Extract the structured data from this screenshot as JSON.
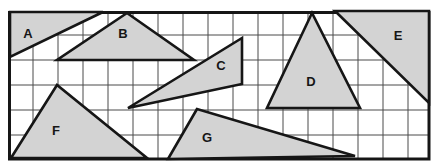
{
  "figure": {
    "background": "#ffffff",
    "frame": {
      "x": 9.5,
      "y": 12.5,
      "width": 419.5,
      "height": 146.5,
      "stroke": "#161616",
      "stroke_width": 3
    },
    "grid": {
      "cell_size": 25,
      "vertical_start": 33,
      "vertical_end": 408,
      "horizontal_start": 35,
      "horizontal_end": 135,
      "color": "#4a4a4a",
      "line_width": 1
    },
    "shape_fill": "#d3d3d3",
    "shape_stroke": "#161616",
    "shape_stroke_width": 2.6,
    "label_color": "#161616",
    "label_font_size": 13,
    "shapes": [
      {
        "label": "A",
        "vertices": [
          [
            10,
            12
          ],
          [
            103,
            12
          ],
          [
            10,
            57
          ]
        ],
        "label_pos": [
          28,
          33
        ]
      },
      {
        "label": "B",
        "vertices": [
          [
            127,
            13
          ],
          [
            57,
            60
          ],
          [
            194,
            60
          ]
        ],
        "label_pos": [
          123,
          33
        ]
      },
      {
        "label": "C",
        "vertices": [
          [
            128,
            108
          ],
          [
            242,
            38
          ],
          [
            242,
            84
          ]
        ],
        "label_pos": [
          221,
          65
        ]
      },
      {
        "label": "D",
        "vertices": [
          [
            312,
            13
          ],
          [
            267,
            108
          ],
          [
            360,
            108
          ]
        ],
        "label_pos": [
          311,
          81
        ]
      },
      {
        "label": "E",
        "vertices": [
          [
            335,
            11
          ],
          [
            429,
            11
          ],
          [
            429,
            103
          ]
        ],
        "label_pos": [
          398,
          35
        ]
      },
      {
        "label": "F",
        "vertices": [
          [
            57,
            85
          ],
          [
            11,
            158
          ],
          [
            147,
            158
          ]
        ],
        "label_pos": [
          56,
          130
        ]
      },
      {
        "label": "G",
        "vertices": [
          [
            197,
            109
          ],
          [
            168,
            159
          ],
          [
            355,
            156
          ]
        ],
        "label_pos": [
          207,
          137
        ]
      }
    ]
  }
}
